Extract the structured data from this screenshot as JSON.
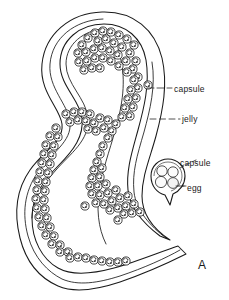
{
  "figure": {
    "letter": "A",
    "background_color": "#ffffff",
    "ink_color": "#1a1a1a"
  },
  "labels": [
    {
      "id": "capsule-main",
      "text": "capsule",
      "leader": "dashed"
    },
    {
      "id": "jelly",
      "text": "jelly",
      "leader": "dashed"
    },
    {
      "id": "capsule-detail",
      "text": "capsule",
      "leader": "dashed"
    },
    {
      "id": "egg",
      "text": "egg",
      "leader": "dashed"
    }
  ],
  "detail_inset": {
    "name": "isolated-capsule",
    "egg_count": 4
  }
}
